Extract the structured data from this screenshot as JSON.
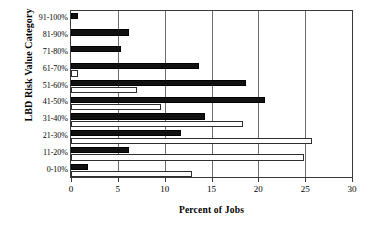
{
  "chart_data": {
    "type": "bar",
    "orientation": "horizontal",
    "title": "",
    "xlabel": "Percent of Jobs",
    "ylabel": "LBD Risk Value Category",
    "xlim": [
      0,
      30
    ],
    "xticks": [
      0,
      5,
      10,
      15,
      20,
      25,
      30
    ],
    "xtick_labels": [
      "0",
      "5",
      "10",
      "15",
      "20",
      "25",
      "30"
    ],
    "grid": "vertical",
    "legend": "none",
    "categories": [
      "91-100%",
      "81-90%",
      "71-80%",
      "61-70%",
      "51-60%",
      "41-50%",
      "31-40%",
      "21-30%",
      "11-20%",
      "0-10%"
    ],
    "series": [
      {
        "name": "black-series",
        "fill": "#111111",
        "values": [
          0.7,
          6.2,
          5.3,
          13.7,
          18.7,
          20.7,
          14.3,
          11.7,
          6.2,
          1.8
        ]
      },
      {
        "name": "white-series",
        "fill": "#ffffff",
        "values": [
          0.0,
          0.0,
          0.0,
          0.7,
          7.0,
          9.6,
          18.4,
          25.7,
          24.9,
          12.9
        ]
      }
    ],
    "colors": {
      "axis": "#3a3a3a",
      "gridline": "#6d6d6d",
      "series_black": "#111111",
      "series_white": "#ffffff",
      "series_white_border": "#2e2e2e",
      "text": "#000000"
    }
  }
}
